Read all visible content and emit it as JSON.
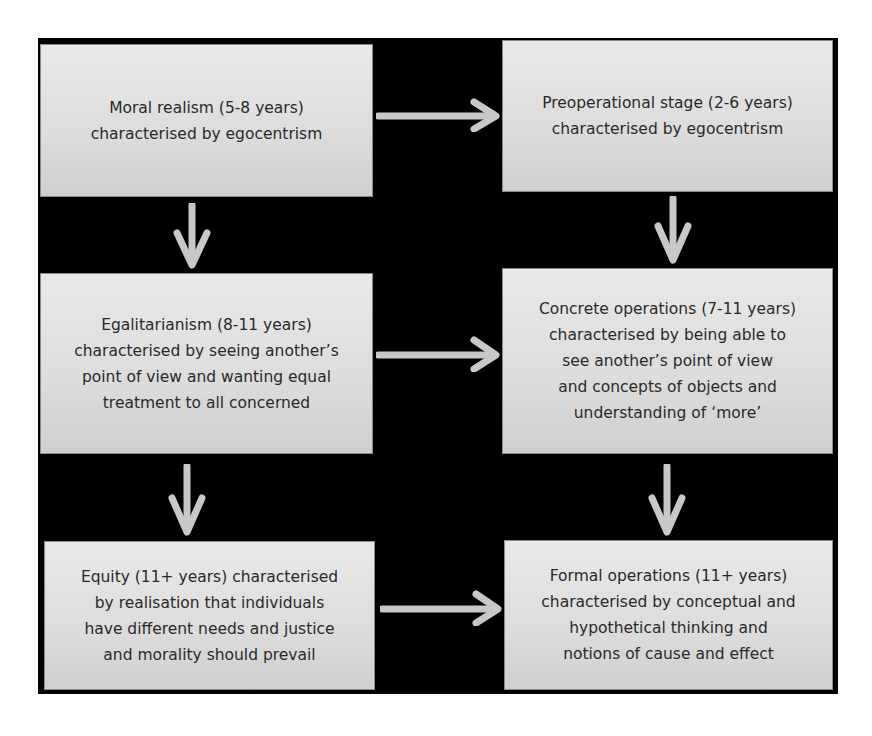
{
  "diagram": {
    "left_column": [
      {
        "id": "moral-realism",
        "text": "Moral realism (5-8 years)\ncharacterised by egocentrism"
      },
      {
        "id": "egalitarianism",
        "text": "Egalitarianism (8-11 years)\ncharacterised by seeing another’s\npoint of view and wanting equal\ntreatment to all concerned"
      },
      {
        "id": "equity",
        "text": "Equity (11+ years) characterised\nby realisation that individuals\nhave different needs and justice\nand morality should prevail"
      }
    ],
    "right_column": [
      {
        "id": "preoperational",
        "text": "Preoperational stage (2-6 years)\ncharacterised by egocentrism"
      },
      {
        "id": "concrete-operations",
        "text": "Concrete operations (7-11 years)\ncharacterised by being able to\nsee another’s point of view\nand concepts of objects and\nunderstanding of ‘more’"
      },
      {
        "id": "formal-operations",
        "text": "Formal operations (11+ years)\ncharacterised by conceptual and\nhypothetical thinking and\nnotions of cause and effect"
      }
    ],
    "edges": [
      {
        "from": "moral-realism",
        "to": "preoperational",
        "direction": "right"
      },
      {
        "from": "egalitarianism",
        "to": "concrete-operations",
        "direction": "right"
      },
      {
        "from": "equity",
        "to": "formal-operations",
        "direction": "right"
      },
      {
        "from": "moral-realism",
        "to": "egalitarianism",
        "direction": "down"
      },
      {
        "from": "egalitarianism",
        "to": "equity",
        "direction": "down"
      },
      {
        "from": "preoperational",
        "to": "concrete-operations",
        "direction": "down"
      },
      {
        "from": "concrete-operations",
        "to": "formal-operations",
        "direction": "down"
      }
    ],
    "colors": {
      "background": "#000000",
      "box_fill": "#dcdcdc",
      "arrow": "#c8c8c8",
      "text": "#2a2a2a"
    }
  }
}
